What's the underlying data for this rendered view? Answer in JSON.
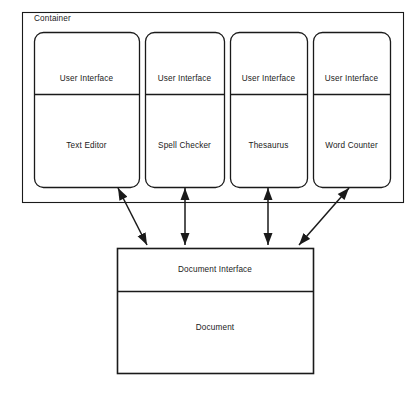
{
  "diagram": {
    "title": "Container",
    "container": {
      "label": "Container",
      "label_x": 34,
      "label_y": 19,
      "outer": {
        "x": 22,
        "y": 12,
        "w": 381,
        "h": 190
      },
      "inner": {
        "x": 33,
        "y": 31,
        "w": 357,
        "h": 156
      }
    },
    "modules": [
      {
        "top_label": "User Interface",
        "bottom_label": "Text Editor",
        "x": 34,
        "y": 32,
        "w": 105,
        "h": 155,
        "divider_y": 94
      },
      {
        "top_label": "User Interface",
        "bottom_label": "Spell Checker",
        "x": 145,
        "y": 32,
        "w": 79,
        "h": 155,
        "divider_y": 94
      },
      {
        "top_label": "User Interface",
        "bottom_label": "Thesaurus",
        "x": 230,
        "y": 32,
        "w": 77,
        "h": 155,
        "divider_y": 94
      },
      {
        "top_label": "User Interface",
        "bottom_label": "Word Counter",
        "x": 313,
        "y": 32,
        "w": 77,
        "h": 155,
        "divider_y": 94
      }
    ],
    "document_box": {
      "top_label": "Document Interface",
      "bottom_label": "Document",
      "x": 117,
      "y": 248,
      "w": 196,
      "h": 125,
      "divider_y": 291
    },
    "connectors": [
      {
        "name": "text-editor-to-document",
        "x1": 118,
        "y1": 188,
        "x2": 147,
        "y2": 245,
        "double": true
      },
      {
        "name": "spell-checker-to-document",
        "x1": 185,
        "y1": 188,
        "x2": 185,
        "y2": 245,
        "double": true
      },
      {
        "name": "thesaurus-to-document",
        "x1": 268,
        "y1": 188,
        "x2": 268,
        "y2": 245,
        "double": true
      },
      {
        "name": "word-counter-to-document",
        "x1": 349,
        "y1": 188,
        "x2": 299,
        "y2": 245,
        "double": true
      }
    ],
    "colors": {
      "stroke": "#1a1a1a",
      "fill": "#ffffff",
      "text": "#1a1a1a"
    }
  }
}
